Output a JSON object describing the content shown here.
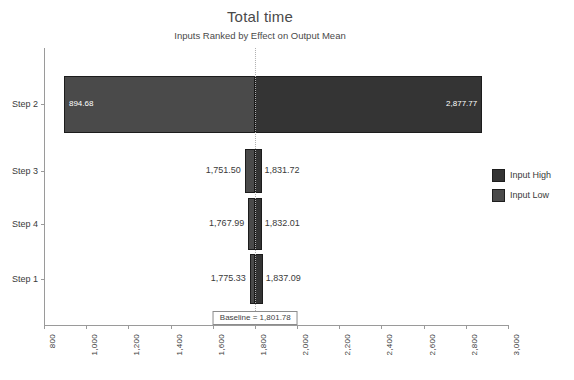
{
  "chart_data": {
    "type": "bar",
    "chart_subtype": "tornado",
    "title": "Total time",
    "subtitle": "Inputs Ranked by Effect on Output Mean",
    "xlabel": "",
    "ylabel": "",
    "xlim": [
      800,
      3000
    ],
    "xticks": [
      "800",
      "1,000",
      "1,200",
      "1,400",
      "1,600",
      "1,800",
      "2,000",
      "2,200",
      "2,400",
      "2,600",
      "2,800",
      "3,000"
    ],
    "xtick_values": [
      800,
      1000,
      1200,
      1400,
      1600,
      1800,
      2000,
      2200,
      2400,
      2600,
      2800,
      3000
    ],
    "grid": false,
    "legend_position": "right",
    "baseline": {
      "value": 1801.78,
      "label": "Baseline = 1,801.78"
    },
    "categories": [
      "Step 2",
      "Step 3",
      "Step 4",
      "Step 1"
    ],
    "series": [
      {
        "name": "Input Low",
        "color": "#4a4a4a",
        "values": [
          894.68,
          1751.5,
          1767.99,
          1775.33
        ]
      },
      {
        "name": "Input High",
        "color": "#343434",
        "values": [
          2877.77,
          1831.72,
          1832.01,
          1837.09
        ]
      }
    ],
    "bars": [
      {
        "category": "Step 2",
        "low": 894.68,
        "high": 2877.77,
        "low_label": "894.68",
        "high_label": "2,877.77",
        "labels_inside": true
      },
      {
        "category": "Step 3",
        "low": 1751.5,
        "high": 1831.72,
        "low_label": "1,751.50",
        "high_label": "1,831.72",
        "labels_inside": false
      },
      {
        "category": "Step 4",
        "low": 1767.99,
        "high": 1832.01,
        "low_label": "1,767.99",
        "high_label": "1,832.01",
        "labels_inside": false
      },
      {
        "category": "Step 1",
        "low": 1775.33,
        "high": 1837.09,
        "low_label": "1,775.33",
        "high_label": "1,837.09",
        "labels_inside": false
      }
    ]
  },
  "legend": {
    "items": [
      {
        "label": "Input High",
        "color": "#343434"
      },
      {
        "label": "Input Low",
        "color": "#4a4a4a"
      }
    ]
  }
}
